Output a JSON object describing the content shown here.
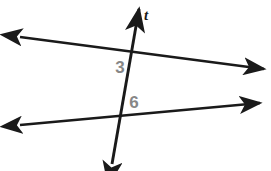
{
  "figure": {
    "background_color": "#ffffff",
    "stroke_color": "#1a1a1a",
    "label_color": "#878787",
    "width": 271,
    "height": 171
  },
  "lines": {
    "transversal": {
      "name": "t",
      "label": "t",
      "label_x": 146,
      "label_y": 20,
      "start_x": 112,
      "start_y": 164,
      "end_x": 139,
      "end_y": 9,
      "arrow_start": true,
      "arrow_end": true
    },
    "upper_parallel": {
      "name": "upper-line",
      "start_x": 20,
      "start_y": 37,
      "end_x": 264,
      "end_y": 69,
      "arrow_start": true,
      "arrow_end": true
    },
    "lower_parallel": {
      "name": "lower-line",
      "start_x": 20,
      "start_y": 125,
      "end_x": 260,
      "end_y": 103,
      "arrow_start": true,
      "arrow_end": true
    }
  },
  "intersections": {
    "upper": {
      "x": 134,
      "y": 53
    },
    "lower": {
      "x": 121,
      "y": 118
    }
  },
  "angle_labels": [
    {
      "name": "angle-3",
      "text": "3",
      "x": 120,
      "y": 73
    },
    {
      "name": "angle-6",
      "text": "6",
      "x": 134,
      "y": 108
    }
  ]
}
